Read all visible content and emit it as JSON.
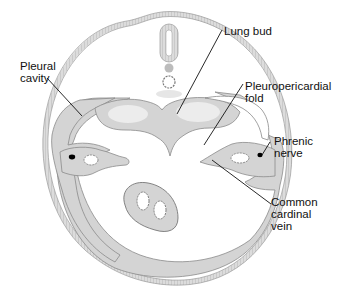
{
  "figure": {
    "type": "embryo transverse section diagram",
    "colors": {
      "tissue": "#d3d3d3",
      "light_tissue": "#e8e8e8",
      "outline": "#8a8a8a",
      "leader": "#111111",
      "nerve": "#000000"
    }
  },
  "labels": {
    "pleural_cavity": "Pleural\ncavity",
    "lung_bud": "Lung bud",
    "pleuropericardial_fold": "Pleuropericardial\nfold",
    "phrenic_nerve": "Phrenic\nnerve",
    "common_cardinal_vein": "Common\ncardinal\nvein"
  }
}
